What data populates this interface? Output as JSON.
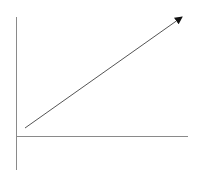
{
  "diagram": {
    "type": "axes-with-arrow",
    "colors": {
      "axis": "#8a8a8a",
      "arrow": "#555555",
      "arrowhead": "#111111",
      "background": "#ffffff"
    },
    "y_axis": {
      "x": 16.5,
      "y1": 17,
      "y2": 170
    },
    "x_axis": {
      "y": 136.5,
      "x1": 16,
      "x2": 188
    },
    "arrow": {
      "x1": 25,
      "y1": 128,
      "x2": 182,
      "y2": 17
    }
  }
}
